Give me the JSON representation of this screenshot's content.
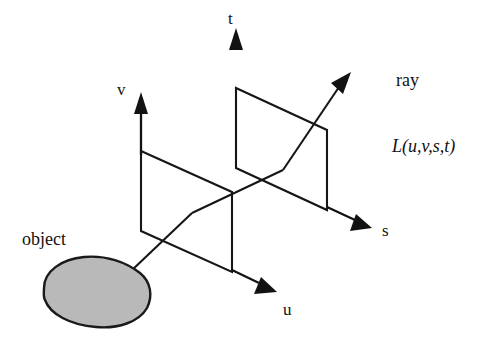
{
  "figure": {
    "canvas": {
      "width": 491,
      "height": 347,
      "background": "#ffffff"
    },
    "colors": {
      "line": "#161616",
      "arrow": "#121212",
      "object_fill": "#b9b9b9",
      "object_stroke": "#1a1a1a",
      "text": "#111111",
      "background": "#ffffff"
    },
    "labels": {
      "axis_t": "t",
      "axis_v": "v",
      "axis_s": "s",
      "axis_u": "u",
      "ray": "ray",
      "radiance_function": "L(u,v,s,t)",
      "object": "object"
    },
    "label_positions": {
      "axis_t": {
        "x": 228,
        "y": 24
      },
      "axis_v": {
        "x": 117,
        "y": 95
      },
      "axis_s": {
        "x": 382,
        "y": 236
      },
      "axis_u": {
        "x": 283,
        "y": 315
      },
      "ray": {
        "x": 396,
        "y": 86
      },
      "radiance_function": {
        "x": 392,
        "y": 152
      },
      "object": {
        "x": 22,
        "y": 245
      }
    },
    "planes": [
      {
        "name": "uv-plane",
        "points": "141,151 232,192 232,272 141,231"
      },
      {
        "name": "st-plane",
        "points": "236,88 327,130 327,210 236,168"
      }
    ],
    "axes": [
      {
        "name": "t-axis",
        "shaft": {
          "x1": 236,
          "y1": 92,
          "x2": 236,
          "y2": 46
        },
        "head": "236,28 243,50 229,50"
      },
      {
        "name": "v-axis",
        "shaft": {
          "x1": 141,
          "y1": 155,
          "x2": 141,
          "y2": 110
        },
        "head": "141,92 148,114 134,114"
      },
      {
        "name": "s-axis",
        "shaft": {
          "x1": 327,
          "y1": 207,
          "x2": 355,
          "y2": 220
        },
        "head": "372,228 350,231 356,214"
      },
      {
        "name": "u-axis",
        "shaft": {
          "x1": 232,
          "y1": 270,
          "x2": 259,
          "y2": 283
        },
        "head": "277,292 254,294 261,277"
      }
    ],
    "ray_path": {
      "name": "light-ray",
      "segments": [
        {
          "from": {
            "x": 130,
            "y": 272
          },
          "to": {
            "x": 192,
            "y": 213
          }
        },
        {
          "from": {
            "x": 192,
            "y": 213
          },
          "to": {
            "x": 283,
            "y": 170
          }
        },
        {
          "from": {
            "x": 283,
            "y": 170
          },
          "to": {
            "x": 339,
            "y": 87
          }
        }
      ],
      "head": "351,72 343,94 331,83"
    },
    "object_shape": {
      "name": "object-blob",
      "path": "M 44,288 C 44,271 62,259 84,257 C 106,255 126,262 140,273 C 151,282 153,296 147,308 C 139,322 118,329 96,327 C 70,325 50,314 45,300 C 43,296 44,292 44,288 Z"
    }
  }
}
